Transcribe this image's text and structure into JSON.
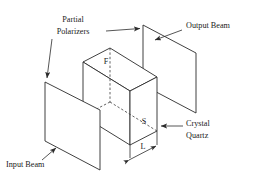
{
  "figure": {
    "background_color": "#ffffff",
    "line_color": "#2b2b2b",
    "text_color": "#1a1a1a"
  },
  "labels": {
    "partial": "Partial",
    "polarizers": "Polarizers",
    "output_beam": "Output Beam",
    "input_beam": "Input Beam",
    "crystal": "Crystal",
    "quartz": "Quartz",
    "fast_axis": "F",
    "slow_axis": "S",
    "length": "L"
  },
  "components": [
    {
      "name": "input-polarizer-plate",
      "kind": "parallelogram",
      "label": "Partial Polarizer (input)"
    },
    {
      "name": "output-polarizer-plate",
      "kind": "parallelogram",
      "label": "Partial Polarizer (output)"
    },
    {
      "name": "crystal-quartz-block",
      "kind": "box",
      "label": "Crystal Quartz"
    }
  ],
  "annotations": [
    {
      "name": "partial-polarizers-to-input-leader",
      "type": "arrow",
      "target": "input-polarizer-plate"
    },
    {
      "name": "partial-polarizers-to-output-leader",
      "type": "arrow",
      "target": "output-polarizer-plate"
    },
    {
      "name": "output-beam-leader",
      "type": "arrow",
      "target": "output-polarizer-plate"
    },
    {
      "name": "input-beam-leader",
      "type": "arrow",
      "target": "input-polarizer-plate"
    },
    {
      "name": "crystal-quartz-leader",
      "type": "arrow",
      "target": "crystal-quartz-block"
    },
    {
      "name": "length-dimension",
      "type": "double-arrow",
      "target": "crystal-quartz-block"
    }
  ]
}
